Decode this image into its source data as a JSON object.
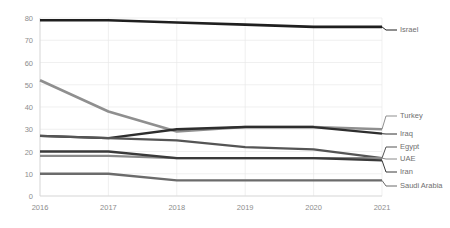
{
  "chart_data": {
    "type": "line",
    "title": "",
    "xlabel": "",
    "ylabel": "",
    "x": [
      2016,
      2017,
      2018,
      2019,
      2020,
      2021
    ],
    "categories": [
      "2016",
      "2017",
      "2018",
      "2019",
      "2020",
      "2021"
    ],
    "ylim": [
      0,
      80
    ],
    "yticks": [
      0,
      10,
      20,
      30,
      40,
      50,
      60,
      70,
      80
    ],
    "ytick_labels": [
      "0",
      "10",
      "20",
      "30",
      "40",
      "50",
      "60",
      "70",
      "80"
    ],
    "grid": true,
    "legend_position": "right",
    "series": [
      {
        "name": "Israel",
        "values": [
          79,
          79,
          78,
          77,
          76,
          76
        ],
        "color": "#1f1f1f",
        "width": 2.6
      },
      {
        "name": "Turkey",
        "values": [
          52,
          38,
          29,
          31,
          31,
          30
        ],
        "color": "#8f8f8f",
        "width": 2.6
      },
      {
        "name": "Iraq",
        "values": [
          27,
          26,
          30,
          31,
          31,
          28
        ],
        "color": "#2e2e2e",
        "width": 2.3
      },
      {
        "name": "Egypt",
        "values": [
          27,
          26,
          25,
          22,
          21,
          17
        ],
        "color": "#555555",
        "width": 2.3
      },
      {
        "name": "UAE",
        "values": [
          18,
          18,
          17,
          17,
          17,
          17
        ],
        "color": "#8a8a8a",
        "width": 2.3
      },
      {
        "name": "Iran",
        "values": [
          20,
          20,
          17,
          17,
          17,
          16
        ],
        "color": "#3a3a3a",
        "width": 2.3
      },
      {
        "name": "Saudi Arabia",
        "values": [
          10,
          10,
          7,
          7,
          7,
          7
        ],
        "color": "#6b6b6b",
        "width": 2.3
      }
    ],
    "legend": [
      {
        "label": "Israel",
        "y": 30,
        "color": "#1f1f1f"
      },
      {
        "label": "Turkey",
        "y": 116,
        "color": "#8f8f8f"
      },
      {
        "label": "Iraq",
        "y": 134,
        "color": "#2e2e2e"
      },
      {
        "label": "Egypt",
        "y": 147,
        "color": "#555555"
      },
      {
        "label": "UAE",
        "y": 159,
        "color": "#8a8a8a"
      },
      {
        "label": "Iran",
        "y": 172,
        "color": "#3a3a3a"
      },
      {
        "label": "Saudi Arabia",
        "y": 186,
        "color": "#6b6b6b"
      }
    ]
  }
}
